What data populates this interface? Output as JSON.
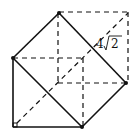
{
  "diagram": {
    "type": "geometry",
    "labels": [
      {
        "id": "side-length",
        "text": "4",
        "radicand": "2",
        "display": "4√2"
      }
    ],
    "vertices": {
      "top": [
        59,
        13
      ],
      "left": [
        13,
        58
      ],
      "right": [
        126,
        83
      ],
      "bottom": [
        82,
        127
      ],
      "bottom_left_corner": [
        13,
        127
      ],
      "dashed_top_right": [
        128,
        12
      ]
    },
    "colors": {
      "stroke": "#111111",
      "background": "#ffffff"
    }
  }
}
